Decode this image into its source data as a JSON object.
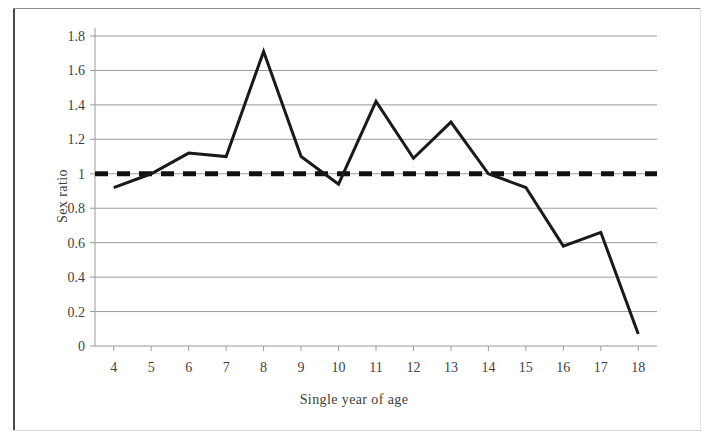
{
  "chart_data": {
    "type": "line",
    "title": "",
    "xlabel": "Single year of age",
    "ylabel": "Sex ratio",
    "x": [
      4,
      5,
      6,
      7,
      8,
      9,
      10,
      11,
      12,
      13,
      14,
      15,
      16,
      17,
      18
    ],
    "categories": [
      "4",
      "5",
      "6",
      "7",
      "8",
      "9",
      "10",
      "11",
      "12",
      "13",
      "14",
      "15",
      "16",
      "17",
      "18"
    ],
    "series": [
      {
        "name": "Sex ratio",
        "values": [
          0.92,
          1.0,
          1.12,
          1.1,
          1.71,
          1.1,
          0.94,
          1.42,
          1.09,
          1.3,
          1.0,
          0.92,
          0.58,
          0.66,
          0.07
        ],
        "color": "#1a1a1a",
        "style": "solid",
        "width": 3
      }
    ],
    "reference_lines": [
      {
        "name": "parity",
        "orientation": "horizontal",
        "value": 1.0,
        "color": "#111111",
        "style": "dashed",
        "width": 5
      }
    ],
    "xlim": [
      3.5,
      18.5
    ],
    "ylim": [
      0,
      1.8
    ],
    "ytick_values": [
      0,
      0.2,
      0.4,
      0.6,
      0.8,
      1.0,
      1.2,
      1.4,
      1.6,
      1.8
    ],
    "ytick_labels": [
      "0",
      "0.2",
      "0.4",
      "0.6",
      "0.8",
      "1",
      "1.2",
      "1.4",
      "1.6",
      "1.8"
    ],
    "grid": {
      "horizontal": true,
      "vertical": false,
      "color": "#9a9a9a"
    },
    "legend": {
      "visible": false,
      "position": "none"
    },
    "axis_color": "#9a9a9a",
    "background": "#ffffff"
  },
  "figure": {
    "border_color": "#4a4a4a"
  }
}
